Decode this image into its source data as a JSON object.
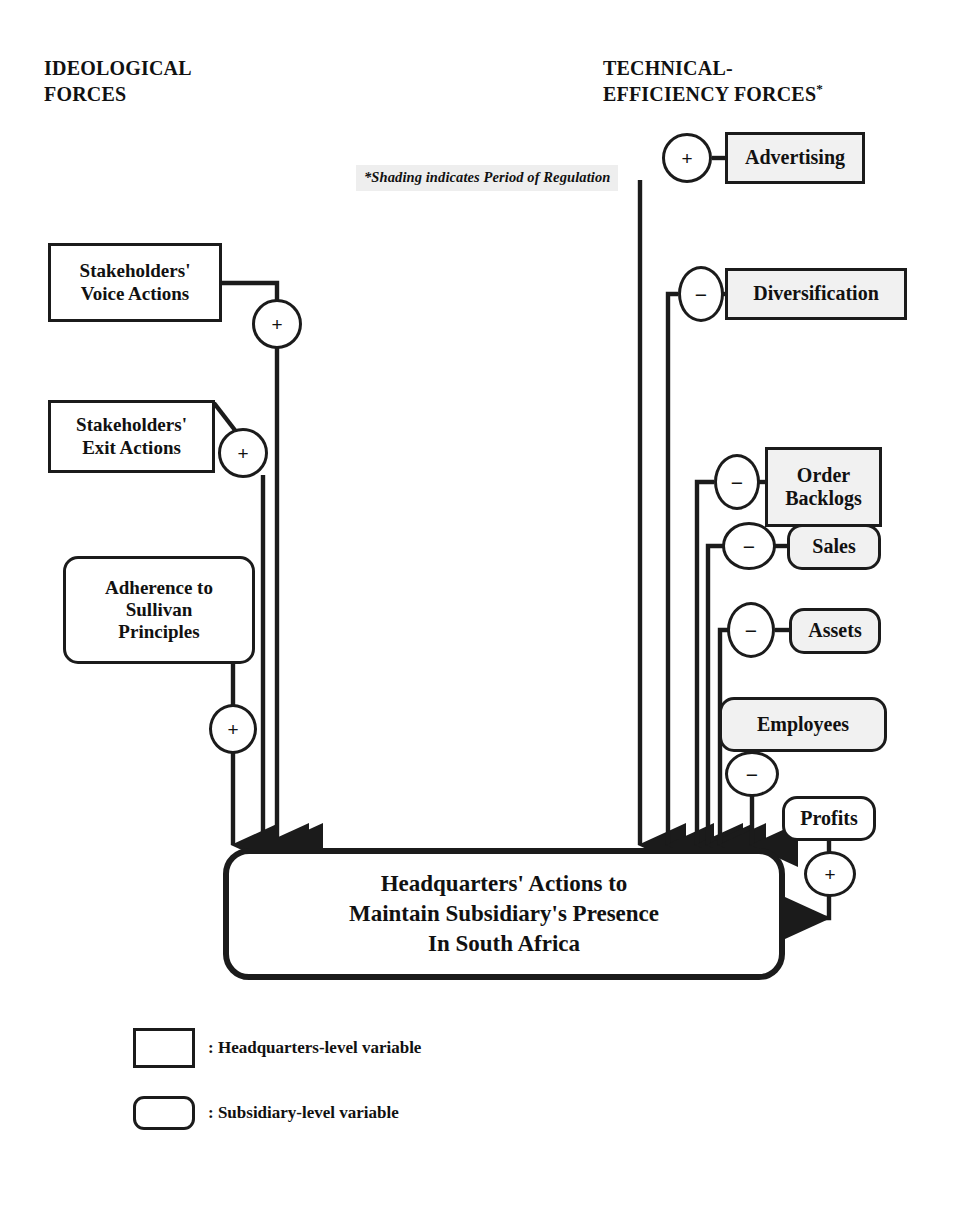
{
  "headers": {
    "left": "IDEOLOGICAL\nFORCES",
    "right": "TECHNICAL-\nEFFICIENCY FORCES",
    "right_superscript": "*"
  },
  "footnote": "*Shading indicates Period of Regulation",
  "colors": {
    "stroke": "#1b1b1b",
    "background": "#ffffff",
    "shaded_fill": "#f1f1f1",
    "footnote_fill": "#eeeeee",
    "text": "#111111"
  },
  "nodes": {
    "advertising": {
      "label": "Advertising",
      "shape": "rectangle",
      "level": "headquarters",
      "shaded": true
    },
    "diversification": {
      "label": "Diversification",
      "shape": "rectangle",
      "level": "headquarters",
      "shaded": true
    },
    "order_backlogs": {
      "label": "Order\nBacklogs",
      "shape": "rectangle",
      "level": "headquarters",
      "shaded": true
    },
    "sales": {
      "label": "Sales",
      "shape": "rounded",
      "level": "subsidiary",
      "shaded": true
    },
    "assets": {
      "label": "Assets",
      "shape": "rounded",
      "level": "subsidiary",
      "shaded": true
    },
    "employees": {
      "label": "Employees",
      "shape": "rounded",
      "level": "subsidiary",
      "shaded": true
    },
    "profits": {
      "label": "Profits",
      "shape": "rounded",
      "level": "subsidiary",
      "shaded": false
    },
    "stakeholders_voice": {
      "label": "Stakeholders'\nVoice Actions",
      "shape": "rectangle",
      "level": "headquarters",
      "shaded": false
    },
    "stakeholders_exit": {
      "label": "Stakeholders'\nExit Actions",
      "shape": "rectangle",
      "level": "headquarters",
      "shaded": false
    },
    "sullivan": {
      "label": "Adherence to\nSullivan\nPrinciples",
      "shape": "rounded",
      "level": "subsidiary",
      "shaded": false
    },
    "headquarters_actions": {
      "label": "Headquarters' Actions to\nMaintain Subsidiary's Presence\nIn South Africa",
      "shape": "rounded",
      "level": "outcome",
      "shaded": false
    }
  },
  "signs": {
    "advertising": "+",
    "diversification": "−",
    "order_backlogs": "−",
    "sales": "−",
    "assets": "−",
    "employees": "−",
    "profits": "+",
    "stakeholders_voice": "+",
    "stakeholders_exit": "+",
    "sullivan": "+"
  },
  "legend": [
    {
      "key": "headquarters",
      "shape": "rectangle",
      "text": ": Headquarters-level variable"
    },
    {
      "key": "subsidiary",
      "shape": "rounded",
      "text": ": Subsidiary-level variable"
    }
  ]
}
